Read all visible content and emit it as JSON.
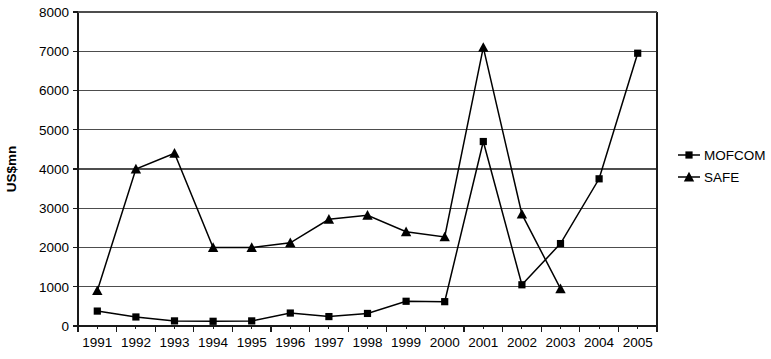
{
  "chart_data": {
    "type": "line",
    "title": "",
    "xlabel": "",
    "ylabel": "US$mn",
    "categories": [
      "1991",
      "1992",
      "1993",
      "1994",
      "1995",
      "1996",
      "1997",
      "1998",
      "1999",
      "2000",
      "2001",
      "2002",
      "2003",
      "2004",
      "2005"
    ],
    "ylim": [
      0,
      8000
    ],
    "ytick_labels": [
      "0",
      "1000",
      "2000",
      "3000",
      "4000",
      "5000",
      "6000",
      "7000",
      "8000"
    ],
    "ytick_values": [
      0,
      1000,
      2000,
      3000,
      4000,
      5000,
      6000,
      7000,
      8000
    ],
    "grid": true,
    "legend_position": "right",
    "series": [
      {
        "name": "MOFCOM",
        "marker": "square",
        "values": [
          380,
          230,
          130,
          120,
          130,
          330,
          240,
          320,
          630,
          620,
          4700,
          1050,
          2100,
          3750,
          6950
        ]
      },
      {
        "name": "SAFE",
        "marker": "triangle",
        "values": [
          900,
          4000,
          4400,
          2000,
          2000,
          2120,
          2720,
          2820,
          2400,
          2270,
          7100,
          2850,
          950,
          null,
          null
        ]
      }
    ],
    "colors": {
      "series_line": "#000000",
      "gridline": "#4d4d4d",
      "axis": "#1a1a1a",
      "background": "#ffffff"
    }
  },
  "legend": {
    "entries": [
      {
        "label": "MOFCOM",
        "marker": "square"
      },
      {
        "label": "SAFE",
        "marker": "triangle"
      }
    ]
  }
}
